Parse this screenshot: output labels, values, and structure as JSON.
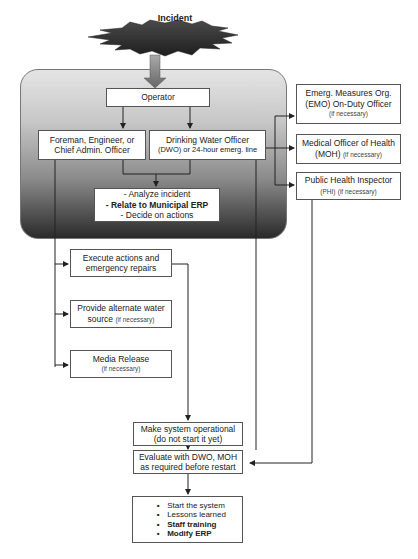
{
  "diagram": {
    "type": "flowchart",
    "start": {
      "label": "Incident",
      "shape": "starburst",
      "color": "#3a3a3a"
    },
    "group_gradient": {
      "top": "#e4e4e4",
      "bottom": "#2a2a2a"
    },
    "nodes": {
      "operator": {
        "label": "Operator"
      },
      "foreman": {
        "line1": "Foreman, Engineer, or",
        "line2": "Chief Admin. Officer"
      },
      "dwo": {
        "line1": "Drinking Water Officer",
        "line2": "(DWO) or 24-hour emerg. line"
      },
      "analyze": {
        "line1": "- Analyze incident",
        "line2": "- Relate to Municipal ERP",
        "line3": "- Decide on actions"
      },
      "emo": {
        "line1": "Emerg. Measures Org.",
        "line2": "(EMO) On-Duty Officer",
        "note": "(if necessary)"
      },
      "moh": {
        "line1": "Medical Officer of Health",
        "line2": "(MOH)",
        "note": "(if necessary)"
      },
      "phi": {
        "line1": "Public Health Inspector",
        "line2": "(PHI)",
        "note": "(if necessary)"
      },
      "execute": {
        "line1": "Execute actions and",
        "line2": "emergency repairs"
      },
      "alternate": {
        "line1": "Provide alternate water",
        "line2": "source",
        "note": "(if necessary)"
      },
      "media": {
        "line1": "Media Release",
        "note": "(if necessary)"
      },
      "operational": {
        "line1": "Make system operational",
        "line2": "(do not start it yet)"
      },
      "evaluate": {
        "line1": "Evaluate with DWO, MOH",
        "line2": "as required before restart"
      },
      "final": {
        "items": [
          {
            "bullet": "•",
            "text": "Start the system"
          },
          {
            "bullet": "•",
            "text": "Lessons learned"
          },
          {
            "bullet": "•",
            "text": "Staff training"
          },
          {
            "bullet": "•",
            "text": "Modify ERP"
          }
        ]
      }
    }
  }
}
